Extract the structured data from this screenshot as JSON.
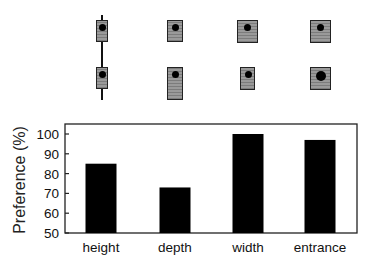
{
  "chart_data": {
    "type": "bar",
    "title": "",
    "xlabel": "",
    "ylabel": "Preference (%)",
    "categories": [
      "height",
      "depth",
      "width",
      "entrance"
    ],
    "values": [
      85,
      73,
      100,
      97
    ],
    "ylim": [
      50,
      105
    ],
    "yticks": [
      50,
      60,
      70,
      80,
      90,
      100
    ],
    "grid": false,
    "legend": null,
    "bar_color": "#000000"
  },
  "illustrations": {
    "description": "Pairs of nest-box icons above each bar comparing dimension variants",
    "columns": [
      {
        "category": "height",
        "top": {
          "w": 10,
          "h": 22
        },
        "bottom": {
          "w": 10,
          "h": 22
        },
        "pole": true
      },
      {
        "category": "depth",
        "top": {
          "w": 15,
          "h": 22
        },
        "bottom": {
          "w": 15,
          "h": 32
        }
      },
      {
        "category": "width",
        "top": {
          "w": 20,
          "h": 22
        },
        "bottom": {
          "w": 14,
          "h": 22
        }
      },
      {
        "category": "entrance",
        "top": {
          "w": 20,
          "h": 22
        },
        "bottom": {
          "w": 20,
          "h": 22
        }
      }
    ]
  }
}
